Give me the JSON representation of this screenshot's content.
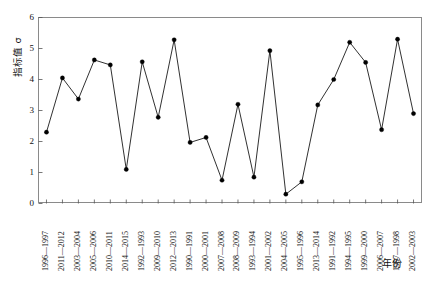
{
  "chart_data": {
    "type": "line",
    "title": "",
    "xlabel": "年份",
    "ylabel": "指标值 σ",
    "ylim": [
      0,
      6
    ],
    "yticks": [
      0,
      1,
      2,
      3,
      4,
      5,
      6
    ],
    "grid": false,
    "legend": null,
    "marker": "filled-circle",
    "line_color": "#1a1a1a",
    "marker_color": "#000000",
    "categories": [
      "1996—1997",
      "2011—2012",
      "2003—2004",
      "2005—2006",
      "2010—2011",
      "2014—2015",
      "1992—1993",
      "2009—2010",
      "2012—2013",
      "1990—1991",
      "2000—2001",
      "2007—2008",
      "2008—2009",
      "1993—1994",
      "2001—2002",
      "2004—2005",
      "1995—1996",
      "2013—2014",
      "1991—1992",
      "1994—1995",
      "1999—2000",
      "2006—2007",
      "1997—1998",
      "2002—2003"
    ],
    "values": [
      2.3,
      4.05,
      3.37,
      4.63,
      4.47,
      1.1,
      4.57,
      2.78,
      5.28,
      1.97,
      2.13,
      0.75,
      3.2,
      0.85,
      4.93,
      0.3,
      0.7,
      3.18,
      4.0,
      5.2,
      4.55,
      2.38,
      5.3,
      2.9
    ]
  },
  "axis": {
    "ytick_labels": [
      "6",
      "5",
      "4",
      "3",
      "2",
      "1",
      "0"
    ]
  }
}
